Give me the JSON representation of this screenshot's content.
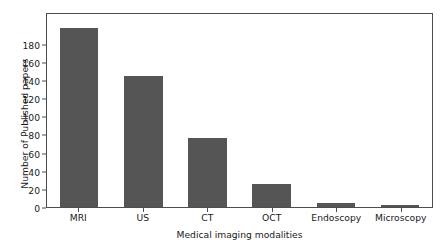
{
  "chart_data": {
    "type": "bar",
    "title": "",
    "xlabel": "Medical imaging modalities",
    "ylabel": "Number of Published papers",
    "categories": [
      "MRI",
      "US",
      "CT",
      "OCT",
      "Endoscopy",
      "Microscopy"
    ],
    "values": [
      197,
      144,
      76,
      25,
      4,
      2
    ],
    "ylim": [
      0,
      215
    ],
    "yticks": [
      0,
      20,
      40,
      60,
      80,
      100,
      120,
      140,
      160,
      180
    ],
    "ytick_labels": [
      "0",
      "20",
      "40",
      "60",
      "80",
      "100",
      "120",
      "140",
      "160",
      "180"
    ],
    "grid": false,
    "legend": null,
    "bar_color": "#555555",
    "axis_color": "#4d4d4d",
    "text_color": "#1a1a1a",
    "background": "#ffffff"
  }
}
